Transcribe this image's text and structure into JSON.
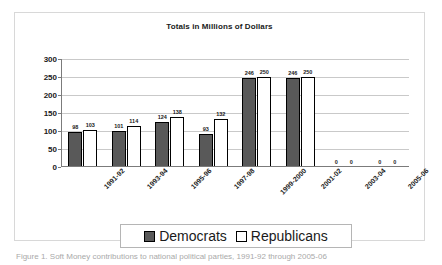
{
  "figure": {
    "caption": "Figure 1. Soft Money contributions to national political parties, 1991-92 through 2005-06"
  },
  "legend": {
    "position": "bottom",
    "entries": [
      {
        "label": "Democrats",
        "swatch": "dem",
        "color": "#595959"
      },
      {
        "label": "Republicans",
        "swatch": "rep",
        "color": "#ffffff"
      }
    ]
  },
  "chart_data": {
    "type": "bar",
    "title": "Totals in Millions of Dollars",
    "xlabel": "",
    "ylabel": "",
    "ylim": [
      0,
      300
    ],
    "yticks": [
      0,
      50,
      100,
      150,
      200,
      250,
      300
    ],
    "grid": true,
    "categories": [
      "1991-92",
      "1993-94",
      "1995-96",
      "1997-98",
      "1999-2000",
      "2001-02",
      "2003-04",
      "2005-06"
    ],
    "series": [
      {
        "name": "Democrats",
        "color": "#595959",
        "values": [
          98,
          101,
          124,
          93,
          246,
          246,
          0,
          0
        ]
      },
      {
        "name": "Republicans",
        "color": "#ffffff",
        "values": [
          103,
          114,
          138,
          132,
          250,
          250,
          0,
          0
        ]
      }
    ]
  }
}
